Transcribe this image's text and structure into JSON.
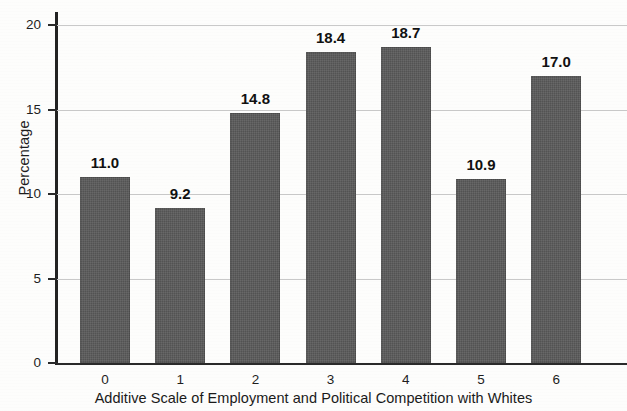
{
  "chart_data": {
    "type": "bar",
    "title": "",
    "xlabel": "Additive Scale of Employment and Political Competition with Whites",
    "ylabel": "Percentage",
    "categories": [
      "0",
      "1",
      "2",
      "3",
      "4",
      "5",
      "6"
    ],
    "values": [
      11.0,
      9.2,
      14.8,
      18.4,
      18.7,
      10.9,
      17.0
    ],
    "data_labels": [
      "11.0",
      "9.2",
      "14.8",
      "18.4",
      "18.7",
      "10.9",
      "17.0"
    ],
    "ylim": [
      0,
      20
    ],
    "y_ticks": [
      0,
      5,
      10,
      15,
      20
    ],
    "y_tick_labels": [
      "0",
      "5",
      "10",
      "15",
      "20"
    ],
    "grid": true,
    "grid_axis": "y",
    "legend": false,
    "bar_color": "#595959",
    "grid_color": "#c9c9c9",
    "axis_color": "#222222",
    "background_color": "#fdfdfc"
  }
}
